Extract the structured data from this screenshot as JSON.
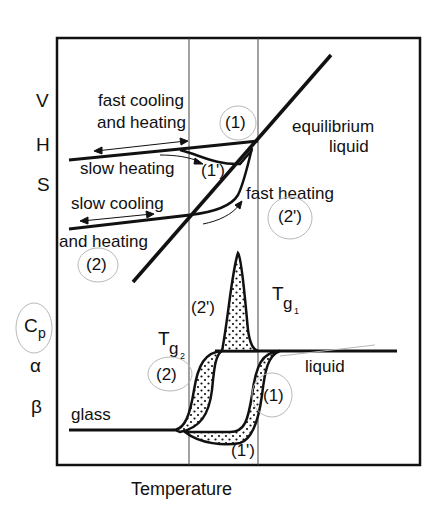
{
  "diagram": {
    "type": "glass-transition schematic",
    "x_axis_label": "Temperature",
    "upper_panel": {
      "y_axis_labels": [
        "V",
        "H",
        "S"
      ],
      "annotations": {
        "fast_cooling_line1": "fast cooling",
        "fast_cooling_line2": "and heating",
        "fast_cooling_tag": "(1)",
        "slow_heating": "slow heating",
        "slow_heating_tag": "(1')",
        "slow_cooling_line1": "slow cooling",
        "slow_cooling_line2": "and heating",
        "slow_cooling_tag": "(2)",
        "fast_heating": "fast heating",
        "fast_heating_tag": "(2')",
        "equilibrium_line1": "equilibrium",
        "equilibrium_line2": "liquid"
      }
    },
    "lower_panel": {
      "y_axis_labels": {
        "cp_main": "C",
        "cp_sub": "p",
        "alpha": "α",
        "beta": "β"
      },
      "annotations": {
        "glass": "glass",
        "liquid": "liquid",
        "tag_2prime": "(2')",
        "tag_2": "(2)",
        "tag_1": "(1)",
        "tag_1prime": "(1')",
        "tg1_main": "T",
        "tg1_sub": "g",
        "tg1_index": "1",
        "tg2_main": "T",
        "tg2_sub": "g",
        "tg2_index": "2"
      }
    },
    "reference_lines": [
      "Tg2",
      "Tg1"
    ]
  }
}
